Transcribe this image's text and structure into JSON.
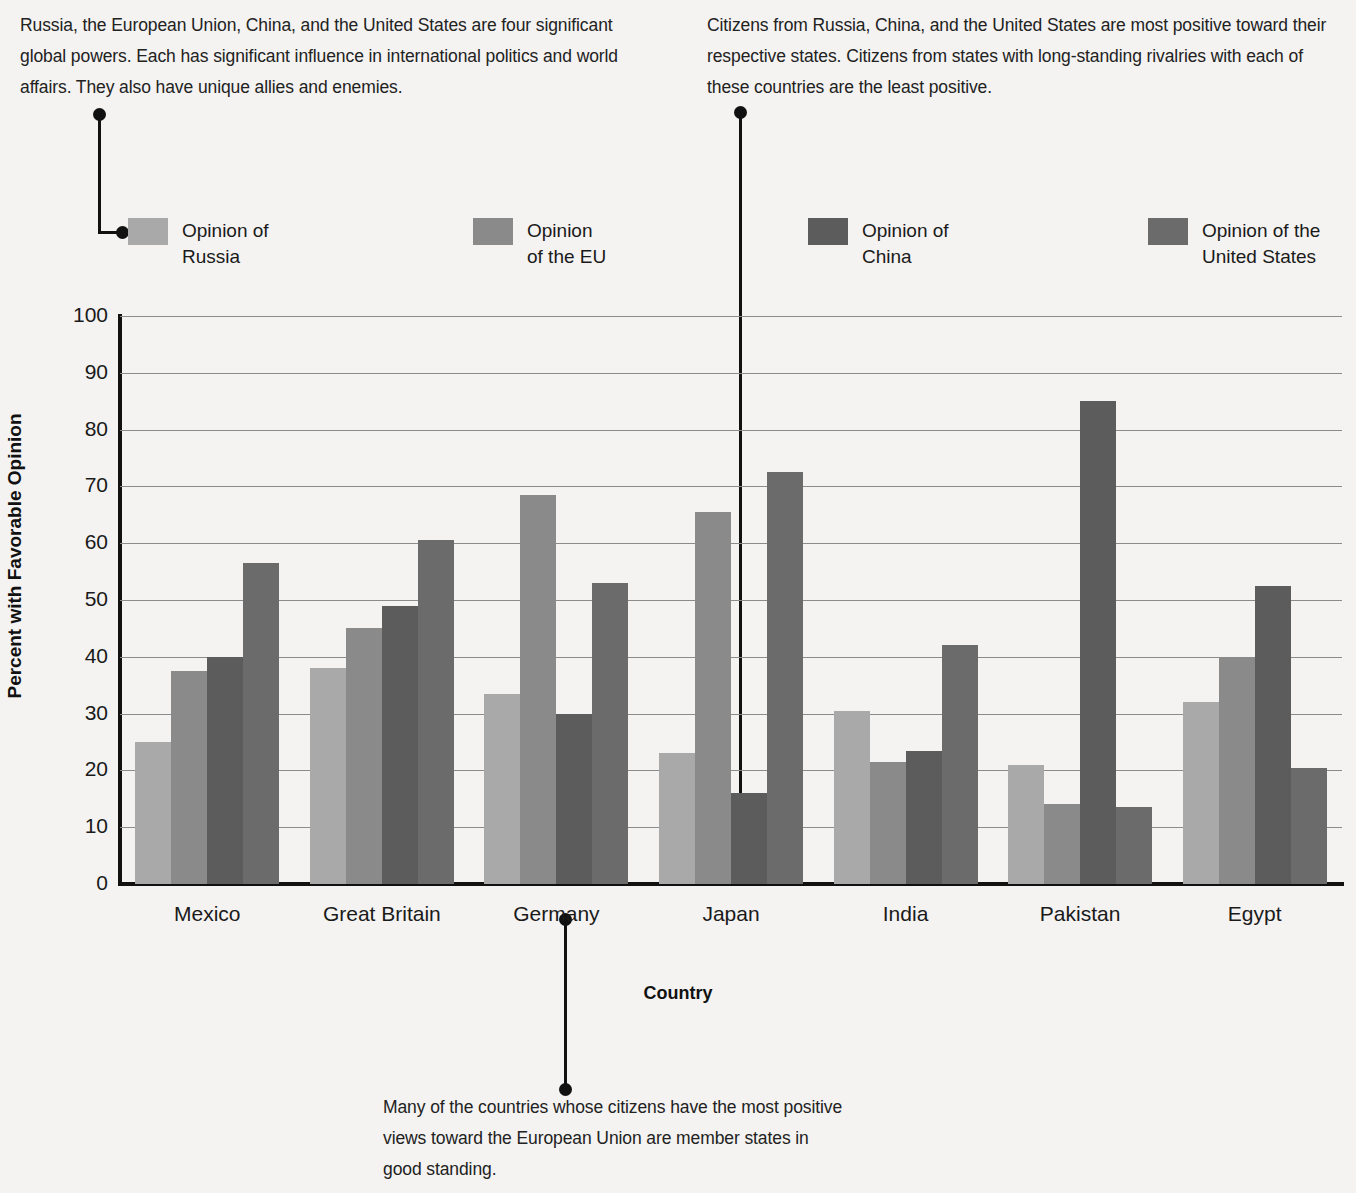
{
  "annotations": {
    "top_left": "Russia, the European Union, China, and the United States are four significant global powers. Each has significant influence in international politics and world affairs. They also have unique allies and enemies.",
    "top_right": "Citizens from Russia, China, and the United States are most positive toward their respective states. Citizens from states with long-standing rivalries with each of these countries are the least positive.",
    "bottom": "Many of the countries whose citizens have the most positive views toward the European Union are member states in good standing."
  },
  "legend": {
    "items": [
      {
        "label": "Opinion of\nRussia",
        "color": "#a9a9a9"
      },
      {
        "label": "Opinion\nof the EU",
        "color": "#8a8a8a"
      },
      {
        "label": "Opinion of\nChina",
        "color": "#5c5c5c"
      },
      {
        "label": "Opinion of the\nUnited States",
        "color": "#6b6b6b"
      }
    ]
  },
  "chart_data": {
    "type": "bar",
    "title": "",
    "xlabel": "Country",
    "ylabel": "Percent with Favorable Opinion",
    "ylim": [
      0,
      100
    ],
    "ytick_labels": [
      "100",
      "90",
      "80",
      "70",
      "60",
      "50",
      "40",
      "30",
      "20",
      "10",
      "0"
    ],
    "ytick_values": [
      100,
      90,
      80,
      70,
      60,
      50,
      40,
      30,
      20,
      10,
      0
    ],
    "grid": true,
    "legend_position": "top",
    "categories": [
      "Mexico",
      "Great Britain",
      "Germany",
      "Japan",
      "India",
      "Pakistan",
      "Egypt"
    ],
    "series": [
      {
        "name": "Opinion of Russia",
        "color": "#a9a9a9",
        "values": [
          25,
          38,
          33.5,
          23,
          30.5,
          21,
          32
        ]
      },
      {
        "name": "Opinion of the EU",
        "color": "#8a8a8a",
        "values": [
          37.5,
          45,
          68.5,
          65.5,
          21.5,
          14,
          40
        ]
      },
      {
        "name": "Opinion of China",
        "color": "#5c5c5c",
        "values": [
          40,
          49,
          30,
          16,
          23.5,
          85,
          52.5
        ]
      },
      {
        "name": "Opinion of the United States",
        "color": "#6b6b6b",
        "values": [
          56.5,
          60.5,
          53,
          72.5,
          42,
          13.5,
          20.5
        ]
      }
    ]
  }
}
